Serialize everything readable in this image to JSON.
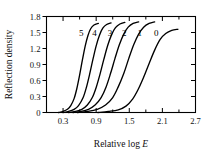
{
  "chart_data": {
    "type": "line",
    "title": "",
    "xlabel": "Relative log E",
    "ylabel": "Reflection density",
    "xlim": [
      0.0,
      2.7
    ],
    "ylim": [
      0.0,
      1.8
    ],
    "xticks": [
      0.3,
      0.9,
      1.5,
      2.1,
      2.7
    ],
    "xticklabels": [
      "0.3",
      "0.9",
      "1.5",
      "2.1",
      "2.7"
    ],
    "yticks": [
      0,
      0.3,
      0.6,
      0.9,
      1.2,
      1.5,
      1.8
    ],
    "yticklabels": [
      "0",
      "0.3",
      "0.6",
      "0.9",
      "1.2",
      "1.5",
      "1.8"
    ],
    "x_minor_ticks": [
      0.6,
      1.2,
      1.8,
      2.4
    ],
    "grid": false,
    "legend": "inline-curve-labels",
    "ticks_direction": "inward",
    "frame": "box",
    "series": [
      {
        "name": "5",
        "label": "5",
        "label_x": 0.63,
        "label_y": 1.44,
        "dmax": 1.67,
        "x": [
          0.22,
          0.3,
          0.38,
          0.44,
          0.5,
          0.55,
          0.6,
          0.65,
          0.7,
          0.75,
          0.8,
          0.86,
          0.94
        ],
        "y": [
          0.0,
          0.02,
          0.06,
          0.13,
          0.26,
          0.45,
          0.7,
          0.98,
          1.24,
          1.44,
          1.57,
          1.64,
          1.67
        ]
      },
      {
        "name": "4",
        "label": "4",
        "label_x": 0.87,
        "label_y": 1.44,
        "dmax": 1.68,
        "x": [
          0.3,
          0.4,
          0.5,
          0.58,
          0.66,
          0.72,
          0.78,
          0.84,
          0.9,
          0.96,
          1.02,
          1.09,
          1.17
        ],
        "y": [
          0.0,
          0.02,
          0.06,
          0.13,
          0.27,
          0.46,
          0.71,
          0.99,
          1.25,
          1.45,
          1.58,
          1.65,
          1.68
        ]
      },
      {
        "name": "3",
        "label": "3",
        "label_x": 1.15,
        "label_y": 1.44,
        "dmax": 1.69,
        "x": [
          0.4,
          0.52,
          0.64,
          0.74,
          0.83,
          0.9,
          0.97,
          1.04,
          1.11,
          1.18,
          1.25,
          1.33,
          1.42
        ],
        "y": [
          0.0,
          0.02,
          0.06,
          0.14,
          0.28,
          0.47,
          0.72,
          1.0,
          1.26,
          1.46,
          1.59,
          1.66,
          1.69
        ]
      },
      {
        "name": "2",
        "label": "2",
        "label_x": 1.41,
        "label_y": 1.44,
        "dmax": 1.7,
        "x": [
          0.48,
          0.62,
          0.76,
          0.88,
          0.99,
          1.08,
          1.16,
          1.24,
          1.32,
          1.4,
          1.48,
          1.57,
          1.67
        ],
        "y": [
          0.0,
          0.02,
          0.06,
          0.14,
          0.28,
          0.48,
          0.73,
          1.01,
          1.27,
          1.47,
          1.6,
          1.67,
          1.7
        ]
      },
      {
        "name": "1",
        "label": "1",
        "label_x": 1.69,
        "label_y": 1.44,
        "dmax": 1.7,
        "x": [
          0.56,
          0.74,
          0.92,
          1.07,
          1.2,
          1.3,
          1.4,
          1.49,
          1.58,
          1.67,
          1.76,
          1.86,
          1.96
        ],
        "y": [
          0.0,
          0.02,
          0.06,
          0.14,
          0.28,
          0.48,
          0.73,
          1.01,
          1.27,
          1.47,
          1.6,
          1.67,
          1.7
        ]
      },
      {
        "name": "0",
        "label": "0",
        "label_x": 1.99,
        "label_y": 1.44,
        "dmax": 1.56,
        "x": [
          0.93,
          1.12,
          1.3,
          1.44,
          1.56,
          1.66,
          1.76,
          1.86,
          1.96,
          2.06,
          2.16,
          2.27,
          2.38
        ],
        "y": [
          0.0,
          0.02,
          0.05,
          0.12,
          0.25,
          0.43,
          0.66,
          0.92,
          1.17,
          1.37,
          1.48,
          1.54,
          1.56
        ]
      }
    ]
  },
  "colors": {
    "curve": "#000000",
    "axis": "#000000",
    "background": "#ffffff"
  }
}
